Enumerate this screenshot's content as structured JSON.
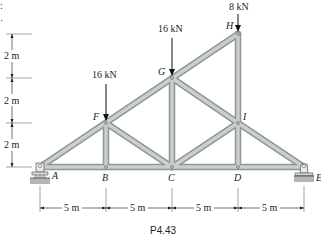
{
  "figure": {
    "caption": "P4.43",
    "corner_marks": [
      ":",
      "·"
    ],
    "nodes": {
      "A": {
        "label": "A",
        "x": 40,
        "y": 167
      },
      "B": {
        "label": "B",
        "x": 106,
        "y": 167
      },
      "C": {
        "label": "C",
        "x": 172,
        "y": 167
      },
      "D": {
        "label": "D",
        "x": 238,
        "y": 167
      },
      "E": {
        "label": "E",
        "x": 304,
        "y": 167
      },
      "F": {
        "label": "F",
        "x": 106,
        "y": 123
      },
      "G": {
        "label": "G",
        "x": 172,
        "y": 78
      },
      "H": {
        "label": "H",
        "x": 238,
        "y": 34
      },
      "I": {
        "label": "I",
        "x": 238,
        "y": 123
      }
    },
    "members": [
      "AB",
      "BC",
      "CD",
      "DE",
      "AF",
      "FG",
      "GH",
      "HI",
      "ID",
      "IE",
      "BF",
      "FC",
      "CG",
      "GI",
      "CI"
    ],
    "loads": [
      {
        "node": "F",
        "label": "16 kN"
      },
      {
        "node": "G",
        "label": "16 kN"
      },
      {
        "node": "H",
        "label": "8 kN"
      }
    ],
    "supports": [
      {
        "node": "A",
        "type": "pin"
      },
      {
        "node": "E",
        "type": "roller"
      }
    ],
    "vertical_dimensions": [
      "2 m",
      "2 m",
      "2 m"
    ],
    "horizontal_dimensions": [
      "5 m",
      "5 m",
      "5 m",
      "5 m"
    ],
    "colors": {
      "member_edge": "#8e9796",
      "member_fill": "#c9cfcd",
      "ground": "#b5b5b5",
      "text": "#222222"
    }
  }
}
